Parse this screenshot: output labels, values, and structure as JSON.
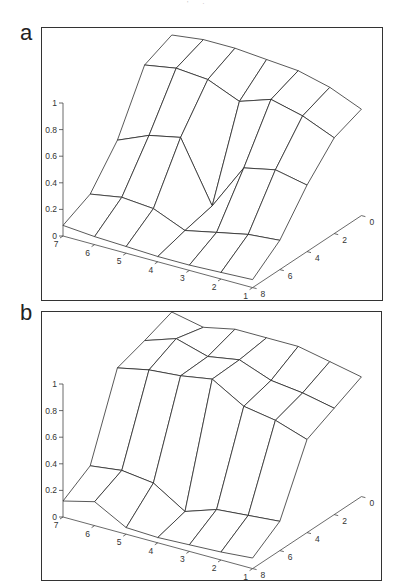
{
  "page": {
    "top_marks": "' ·"
  },
  "chart_data": [
    {
      "id": "a",
      "panel_label": "a",
      "type": "surface3d",
      "title": "",
      "xlabel": "",
      "ylabel": "",
      "zlabel": "",
      "x_ticks": [
        7,
        6,
        5,
        4,
        3,
        2,
        1
      ],
      "y_ticks": [
        0,
        2,
        4,
        6,
        8
      ],
      "z_ticks": [
        0,
        0.2,
        0.4,
        0.6,
        0.8,
        1
      ],
      "z_tick_labels": [
        "0",
        "0.2",
        "0.4",
        "0.6",
        "0.8",
        "1"
      ],
      "x": [
        7,
        6,
        5,
        4,
        3,
        2,
        1
      ],
      "y": [
        0,
        2,
        4,
        6,
        8
      ],
      "z": [
        [
          0.97,
          1.0,
          1.0,
          0.98,
          0.96,
          0.9,
          0.8
        ],
        [
          0.88,
          0.92,
          0.9,
          0.8,
          0.88,
          0.82,
          0.72
        ],
        [
          0.45,
          0.55,
          0.6,
          0.15,
          0.5,
          0.55,
          0.5
        ],
        [
          0.18,
          0.22,
          0.2,
          0.1,
          0.15,
          0.2,
          0.22
        ],
        [
          0.08,
          0.06,
          0.05,
          0.04,
          0.04,
          0.05,
          0.06
        ]
      ],
      "zlim": [
        0,
        1
      ],
      "grid": false
    },
    {
      "id": "b",
      "panel_label": "b",
      "type": "surface3d",
      "title": "",
      "xlabel": "",
      "ylabel": "",
      "zlabel": "",
      "x_ticks": [
        7,
        6,
        5,
        4,
        3,
        2,
        1
      ],
      "y_ticks": [
        0,
        2,
        4,
        6,
        8
      ],
      "z_ticks": [
        0,
        0.2,
        0.4,
        0.6,
        0.8,
        1
      ],
      "z_tick_labels": [
        "0",
        "0.2",
        "0.4",
        "0.6",
        "0.8",
        "1"
      ],
      "x": [
        7,
        6,
        5,
        4,
        3,
        2,
        1
      ],
      "y": [
        0,
        2,
        4,
        6,
        8
      ],
      "z": [
        [
          1.0,
          0.95,
          1.0,
          1.0,
          1.0,
          0.95,
          0.9
        ],
        [
          0.92,
          1.0,
          0.93,
          0.97,
          0.88,
          0.85,
          0.8
        ],
        [
          0.85,
          0.9,
          0.92,
          0.96,
          0.82,
          0.78,
          0.7
        ],
        [
          0.25,
          0.28,
          0.25,
          0.1,
          0.18,
          0.2,
          0.22
        ],
        [
          0.12,
          0.18,
          0.05,
          0.04,
          0.05,
          0.06,
          0.08
        ]
      ],
      "zlim": [
        0,
        1
      ],
      "grid": false
    }
  ]
}
